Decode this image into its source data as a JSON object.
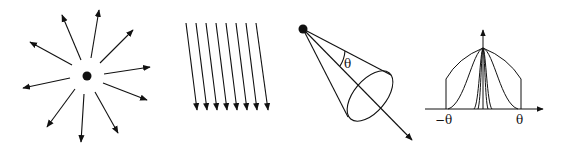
{
  "panels": [
    {
      "id": "point-light",
      "description": "Point light radiating in all directions"
    },
    {
      "id": "directional-light",
      "description": "Parallel directional light rays"
    },
    {
      "id": "spot-light",
      "description": "Spot light cone with angle",
      "angle_label": "θ"
    },
    {
      "id": "spot-falloff-plot",
      "description": "Intensity falloff curves",
      "x_min_label": "−θ",
      "x_max_label": "θ"
    }
  ],
  "colors": {
    "stroke": "#111111",
    "background": "#ffffff"
  }
}
